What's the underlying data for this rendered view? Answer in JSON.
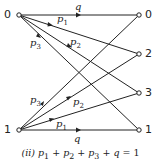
{
  "diagram": {
    "colors": {
      "line": "#222222",
      "text": "#222222",
      "background": "#ffffff"
    },
    "inputs": [
      {
        "id": "in0",
        "label": "0",
        "x": 19,
        "y": 15
      },
      {
        "id": "in1",
        "label": "1",
        "x": 19,
        "y": 130
      }
    ],
    "outputs": [
      {
        "id": "out0",
        "label": "0",
        "x": 139,
        "y": 15
      },
      {
        "id": "out2",
        "label": "2",
        "x": 139,
        "y": 54
      },
      {
        "id": "out3",
        "label": "3",
        "x": 139,
        "y": 93
      },
      {
        "id": "out1",
        "label": "1",
        "x": 139,
        "y": 130
      }
    ],
    "edges": [
      {
        "from": "in0",
        "to": "out0",
        "label": "q"
      },
      {
        "from": "in0",
        "to": "out2",
        "label": "p1"
      },
      {
        "from": "in0",
        "to": "out3",
        "label": "p2"
      },
      {
        "from": "in0",
        "to": "out1",
        "label": "p3"
      },
      {
        "from": "in1",
        "to": "out1",
        "label": "q"
      },
      {
        "from": "in1",
        "to": "out3",
        "label": "p1"
      },
      {
        "from": "in1",
        "to": "out2",
        "label": "p2"
      },
      {
        "from": "in1",
        "to": "out0",
        "label": "p3"
      }
    ],
    "edge_labels": {
      "q_top": "q",
      "p1_top": "p",
      "p1_top_sub": "1",
      "p2_top": "p",
      "p2_top_sub": "2",
      "p3_top": "p",
      "p3_top_sub": "3",
      "q_bottom": "q",
      "p1_bottom": "p",
      "p1_bottom_sub": "1",
      "p2_bottom": "p",
      "p2_bottom_sub": "2",
      "p3_bottom": "p",
      "p3_bottom_sub": "3"
    },
    "caption": {
      "prefix": "(ii)",
      "equation": "p1 + p2 + p3 + q = 1",
      "p": "p",
      "s1": "1",
      "s2": "2",
      "s3": "3",
      "plus": " + ",
      "q": "q",
      "eq": " = 1"
    }
  }
}
